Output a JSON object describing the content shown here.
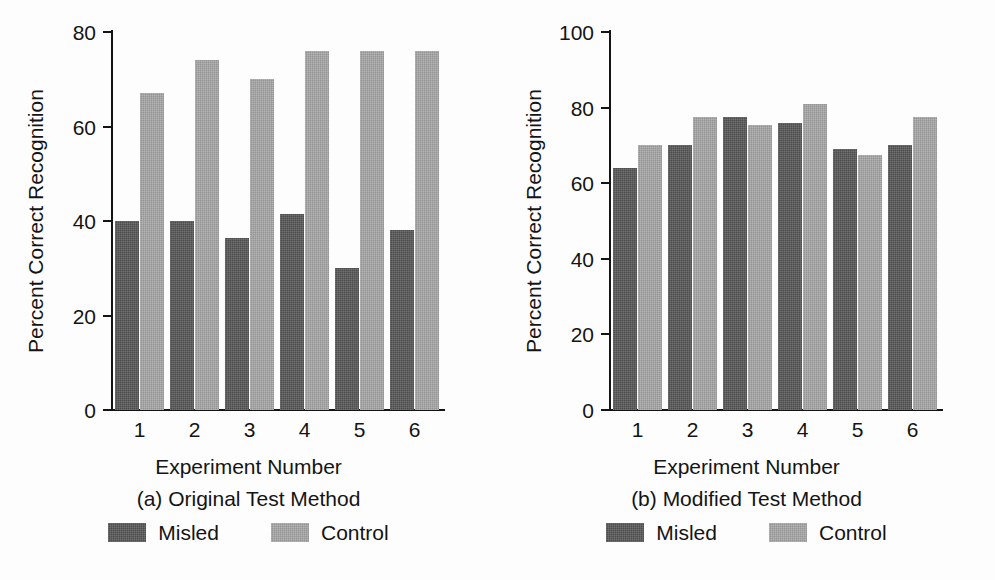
{
  "figure": {
    "background_color": "#fdfdfd",
    "axis_color": "#141414",
    "misled_color": "#4d4d4d",
    "control_color": "#949494"
  },
  "chart_data": [
    {
      "type": "bar",
      "panel_id": "a",
      "title": "",
      "caption_main": "Experiment Number",
      "caption_sub": "(a) Original Test Method",
      "xlabel": "Experiment Number",
      "ylabel": "Percent Correct Recognition",
      "categories": [
        "1",
        "2",
        "3",
        "4",
        "5",
        "6"
      ],
      "ylim": [
        0,
        80
      ],
      "yticks": [
        0,
        20,
        40,
        60,
        80
      ],
      "ytick_labels": [
        "0",
        "20",
        "40",
        "60",
        "80"
      ],
      "grid": false,
      "legend_position": "below",
      "series": [
        {
          "name": "Misled",
          "color": "#4d4d4d",
          "values": [
            40,
            40,
            36.5,
            41.5,
            30,
            38
          ]
        },
        {
          "name": "Control",
          "color": "#949494",
          "values": [
            67,
            74,
            70,
            76,
            76,
            76
          ]
        }
      ]
    },
    {
      "type": "bar",
      "panel_id": "b",
      "title": "",
      "caption_main": "Experiment Number",
      "caption_sub": "(b) Modified Test Method",
      "xlabel": "Experiment Number",
      "ylabel": "Percent Correct Recognition",
      "categories": [
        "1",
        "2",
        "3",
        "4",
        "5",
        "6"
      ],
      "ylim": [
        0,
        100
      ],
      "yticks": [
        0,
        20,
        40,
        60,
        80,
        100
      ],
      "ytick_labels": [
        "0",
        "20",
        "40",
        "60",
        "80",
        "100"
      ],
      "grid": false,
      "legend_position": "below",
      "series": [
        {
          "name": "Misled",
          "color": "#4d4d4d",
          "values": [
            64,
            70,
            77.5,
            76,
            69,
            70
          ]
        },
        {
          "name": "Control",
          "color": "#949494",
          "values": [
            70,
            77.5,
            75.5,
            81,
            67.5,
            77.5
          ]
        }
      ]
    }
  ],
  "legend": {
    "items": [
      {
        "label": "Misled",
        "color": "#4d4d4d"
      },
      {
        "label": "Control",
        "color": "#949494"
      }
    ]
  }
}
